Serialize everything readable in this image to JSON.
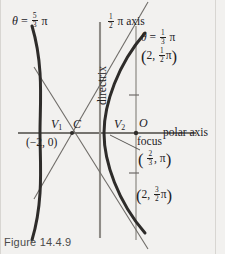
{
  "figure": {
    "caption": "Figure 14.4.9",
    "type": "conic-section-polar-diagram",
    "curve": "hyperbola"
  },
  "labels": {
    "theta_upper_left": {
      "theta": "θ",
      "equals": "=",
      "num": "5",
      "den": "3",
      "pi": "π"
    },
    "theta_upper_right": {
      "theta": "θ",
      "equals": "=",
      "num": "1",
      "den": "3",
      "pi": "π"
    },
    "half_pi_axis": {
      "num": "1",
      "den": "2",
      "pi": "π",
      "text": "axis"
    },
    "directrix": "directrix",
    "polar_axis": "polar axis",
    "focus": "focus",
    "vertex_left": {
      "v": "V",
      "sub": "1"
    },
    "vertex_right": {
      "v": "V",
      "sub": "2"
    },
    "center": "C",
    "origin": "O",
    "point_left_cartesian": "(−2, 0)",
    "point_top": {
      "open": "(",
      "r": "2,",
      "num": "1",
      "den": "2",
      "pi": "π",
      "close": ")"
    },
    "point_focus_dir": {
      "open": "(",
      "num": "2",
      "den": "3",
      "comma": ",",
      "pi": "π",
      "close": ")"
    },
    "point_bottom": {
      "open": "(",
      "r": "2,",
      "num": "3",
      "den": "2",
      "pi": "π",
      "close": ")"
    }
  },
  "colors": {
    "curve": "#2e2c2a",
    "asymptote": "#6f6c68",
    "axis": "#4b4845",
    "directrix": "#8f8c87",
    "half_pi_axis": "#9a9792",
    "background": "#f2f1ef",
    "caption": "#4a4a4a"
  },
  "geometry": {
    "polar_axis_y": 133,
    "center_x": 72,
    "directrix_x": 100,
    "half_pi_axis_x": 136,
    "vertex_left_x": 40,
    "vertex_right_x": 104,
    "focus_x": 136,
    "tick_y_upper": 95,
    "tick_y_lower": 173
  }
}
